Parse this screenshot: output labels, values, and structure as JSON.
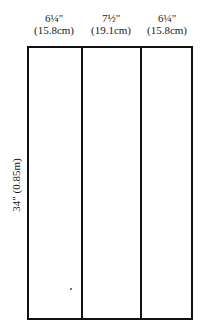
{
  "columns": [
    {
      "width_in": "6¼\"",
      "width_cm": "(15.8cm)"
    },
    {
      "width_in": "7½\"",
      "width_cm": "(19.1cm)"
    },
    {
      "width_in": "6¼\"",
      "width_cm": "(15.8cm)"
    }
  ],
  "height_label": "34\" (0.85m)"
}
